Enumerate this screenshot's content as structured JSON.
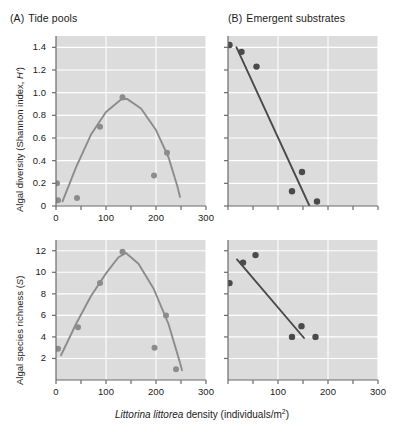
{
  "panels": {
    "a": {
      "tag": "(A)",
      "title": "Tide pools"
    },
    "b": {
      "tag": "(B)",
      "title": "Emergent substrates"
    }
  },
  "axis_caption": {
    "species": "Littorina littorea",
    "rest": " density (individuals/m",
    "sup": "2",
    "close": ")"
  },
  "colors": {
    "plot_background": "#dcdcdc",
    "gridline": "#ffffff",
    "axis": "#6b6b6b",
    "panel_a_marker": "#8c8c8c",
    "panel_a_curve": "#8c8c8c",
    "panel_b_marker": "#4a4a4a",
    "panel_b_line": "#4a4a4a",
    "text": "#1a1a1a"
  },
  "chart_data": [
    {
      "id": "a-upper",
      "type": "scatter",
      "title": "Tide pools",
      "xlabel": "Littorina littorea density (individuals/m2)",
      "ylabel": "Algal diversity (Shannon index, H')",
      "xlim": [
        0,
        300
      ],
      "ylim": [
        0,
        1.5
      ],
      "xticks": [
        0,
        100,
        200,
        300
      ],
      "xminorticks": [
        50,
        150,
        250
      ],
      "yticks": [
        0,
        0.2,
        0.4,
        0.6,
        0.8,
        1.0,
        1.2,
        1.4
      ],
      "ytick_labels": [
        "0",
        "0.2",
        "0.4",
        "0.6",
        "0.8",
        "1.0",
        "1.2",
        "1.4"
      ],
      "xtick_labels": [
        "0",
        "100",
        "200",
        "300"
      ],
      "grid": true,
      "fit": "unimodal-quadratic",
      "points": [
        {
          "x": 2,
          "y": 0.2
        },
        {
          "x": 4,
          "y": 0.05
        },
        {
          "x": 42,
          "y": 0.07
        },
        {
          "x": 88,
          "y": 0.7
        },
        {
          "x": 133,
          "y": 0.96
        },
        {
          "x": 222,
          "y": 0.47
        },
        {
          "x": 196,
          "y": 0.27
        }
      ],
      "curve": [
        {
          "x": 13,
          "y": 0.04
        },
        {
          "x": 40,
          "y": 0.34
        },
        {
          "x": 70,
          "y": 0.63
        },
        {
          "x": 100,
          "y": 0.83
        },
        {
          "x": 130,
          "y": 0.94
        },
        {
          "x": 142,
          "y": 0.945
        },
        {
          "x": 170,
          "y": 0.86
        },
        {
          "x": 200,
          "y": 0.67
        },
        {
          "x": 225,
          "y": 0.43
        },
        {
          "x": 243,
          "y": 0.17
        },
        {
          "x": 248,
          "y": 0.08
        }
      ]
    },
    {
      "id": "a-lower",
      "type": "scatter",
      "xlabel": "Littorina littorea density (individuals/m2)",
      "ylabel": "Algal species richness (S)",
      "xlim": [
        0,
        300
      ],
      "ylim": [
        0,
        13
      ],
      "xticks": [
        0,
        100,
        200,
        300
      ],
      "xminorticks": [
        50,
        150,
        250
      ],
      "yticks": [
        2,
        4,
        6,
        8,
        10,
        12
      ],
      "ytick_labels": [
        "2",
        "4",
        "6",
        "8",
        "10",
        "12"
      ],
      "xtick_labels": [
        "0",
        "100",
        "200",
        "300"
      ],
      "grid": true,
      "fit": "unimodal-quadratic",
      "points": [
        {
          "x": 4,
          "y": 2.9
        },
        {
          "x": 44,
          "y": 4.9
        },
        {
          "x": 88,
          "y": 9.0
        },
        {
          "x": 133,
          "y": 11.9
        },
        {
          "x": 220,
          "y": 6.0
        },
        {
          "x": 197,
          "y": 3.0
        },
        {
          "x": 240,
          "y": 1.0
        }
      ],
      "curve": [
        {
          "x": 10,
          "y": 2.3
        },
        {
          "x": 40,
          "y": 5.2
        },
        {
          "x": 70,
          "y": 7.8
        },
        {
          "x": 100,
          "y": 9.9
        },
        {
          "x": 125,
          "y": 11.4
        },
        {
          "x": 140,
          "y": 11.8
        },
        {
          "x": 165,
          "y": 10.8
        },
        {
          "x": 195,
          "y": 8.5
        },
        {
          "x": 225,
          "y": 5.2
        },
        {
          "x": 248,
          "y": 1.6
        },
        {
          "x": 252,
          "y": 0.9
        }
      ]
    },
    {
      "id": "b-upper",
      "type": "scatter",
      "title": "Emergent substrates",
      "xlabel": "Littorina littorea density (individuals/m2)",
      "ylabel": "Algal diversity (Shannon index, H')",
      "xlim": [
        0,
        300
      ],
      "ylim": [
        0,
        1.5
      ],
      "xticks": [
        0,
        100,
        200,
        300
      ],
      "xminorticks": [
        50,
        150,
        250
      ],
      "yticks": [
        0,
        0.2,
        0.4,
        0.6,
        0.8,
        1.0,
        1.2,
        1.4
      ],
      "ytick_labels": [],
      "xtick_labels": [],
      "grid": true,
      "fit": "linear-decline",
      "points": [
        {
          "x": 3,
          "y": 1.42
        },
        {
          "x": 27,
          "y": 1.36
        },
        {
          "x": 57,
          "y": 1.23
        },
        {
          "x": 128,
          "y": 0.13
        },
        {
          "x": 148,
          "y": 0.3
        },
        {
          "x": 178,
          "y": 0.04
        }
      ],
      "line": {
        "x1": 17,
        "y1": 1.4,
        "x2": 163,
        "y2": 0.0
      }
    },
    {
      "id": "b-lower",
      "type": "scatter",
      "xlabel": "Littorina littorea density (individuals/m2)",
      "ylabel": "Algal species richness (S)",
      "xlim": [
        0,
        300
      ],
      "ylim": [
        0,
        13
      ],
      "xticks": [
        0,
        100,
        200,
        300
      ],
      "xminorticks": [
        50,
        150,
        250
      ],
      "yticks": [
        2,
        4,
        6,
        8,
        10,
        12
      ],
      "ytick_labels": [],
      "xtick_labels": [
        "100",
        "200",
        "300"
      ],
      "grid": true,
      "fit": "linear-decline",
      "points": [
        {
          "x": 3,
          "y": 9.0
        },
        {
          "x": 30,
          "y": 10.9
        },
        {
          "x": 55,
          "y": 11.6
        },
        {
          "x": 128,
          "y": 4.0
        },
        {
          "x": 147,
          "y": 5.0
        },
        {
          "x": 175,
          "y": 4.0
        }
      ],
      "line": {
        "x1": 18,
        "y1": 11.2,
        "x2": 152,
        "y2": 3.9
      }
    }
  ]
}
